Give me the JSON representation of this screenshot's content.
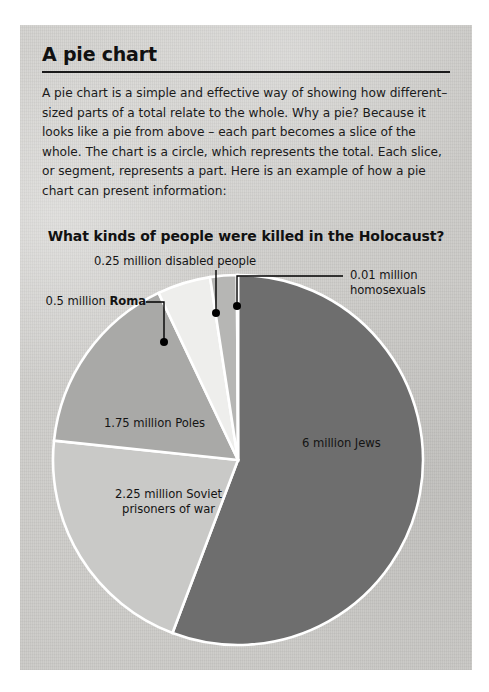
{
  "page": {
    "title": "A pie chart",
    "body": "A pie chart is a simple and effective way of showing how different–sized parts of a total relate to the whole. Why a pie? Because it looks like a pie from above – each part becomes a slice of the whole. The chart is a circle, which represents the total. Each slice, or segment, represents a part. Here is an example of how a pie chart can present information:"
  },
  "labels": {
    "jews": "6 million Jews",
    "soviet_line1": "2.25 million Soviet",
    "soviet_line2": "prisoners of war",
    "poles": "1.75 million Poles",
    "roma_prefix": "0.5 million ",
    "roma_bold": "Roma",
    "disabled": "0.25 million disabled people",
    "homosexuals_line1": "0.01 million",
    "homosexuals_line2": "homosexuals"
  },
  "chart_data": {
    "type": "pie",
    "title": "What kinds of people were killed in the Holocaust?",
    "unit": "million people",
    "total": 10.76,
    "legend": "none",
    "labels_position": "inside and callout",
    "categories": [
      "Jews",
      "Soviet prisoners of war",
      "Poles",
      "Roma",
      "disabled people",
      "homosexuals"
    ],
    "values": [
      6,
      2.25,
      1.75,
      0.5,
      0.25,
      0.01
    ],
    "value_labels": [
      "6 million Jews",
      "2.25 million Soviet prisoners of war",
      "1.75 million Poles",
      "0.5 million Roma",
      "0.25 million disabled people",
      "0.01 million homosexuals"
    ],
    "colors": [
      "#6e6e6e",
      "#c9c9c7",
      "#a9a9a7",
      "#eeeeec",
      "#b6b6b4",
      "#8c8c8a"
    ],
    "start_angle_deg": 0,
    "direction": "clockwise",
    "center": [
      240,
      432
    ],
    "radius": 185
  },
  "colors": {
    "page_bg": "#cfcecb",
    "text": "#141414",
    "rule": "#1a1a1a",
    "slice_border": "#ffffff",
    "callout": "#000000"
  }
}
